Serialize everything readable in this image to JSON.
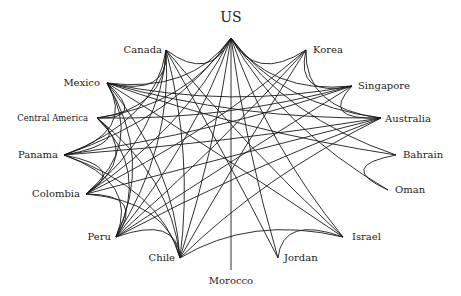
{
  "diagram": {
    "type": "network",
    "nodes": [
      {
        "id": "US",
        "label": "US",
        "x": 231,
        "y": 38,
        "lx": 231,
        "ly": 22,
        "anchor": "middle",
        "size": "big"
      },
      {
        "id": "Canada",
        "label": "Canada",
        "x": 166,
        "y": 50,
        "lx": 162,
        "ly": 53,
        "anchor": "end",
        "size": "normal"
      },
      {
        "id": "Korea",
        "label": "Korea",
        "x": 306,
        "y": 50,
        "lx": 313,
        "ly": 53,
        "anchor": "start",
        "size": "normal"
      },
      {
        "id": "Mexico",
        "label": "Mexico",
        "x": 107,
        "y": 83,
        "lx": 100,
        "ly": 86,
        "anchor": "end",
        "size": "normal"
      },
      {
        "id": "Singapore",
        "label": "Singapore",
        "x": 352,
        "y": 86,
        "lx": 358,
        "ly": 89,
        "anchor": "start",
        "size": "normal"
      },
      {
        "id": "CentralAmerica",
        "label": "Central America",
        "x": 97,
        "y": 118,
        "lx": 88,
        "ly": 121,
        "anchor": "end",
        "size": "small"
      },
      {
        "id": "Australia",
        "label": "Australia",
        "x": 381,
        "y": 118,
        "lx": 385,
        "ly": 122,
        "anchor": "start",
        "size": "normal"
      },
      {
        "id": "Panama",
        "label": "Panama",
        "x": 64,
        "y": 155,
        "lx": 58,
        "ly": 158,
        "anchor": "end",
        "size": "normal"
      },
      {
        "id": "Bahrain",
        "label": "Bahrain",
        "x": 396,
        "y": 155,
        "lx": 403,
        "ly": 158,
        "anchor": "start",
        "size": "normal"
      },
      {
        "id": "Colombia",
        "label": "Colombia",
        "x": 86,
        "y": 194,
        "lx": 80,
        "ly": 197,
        "anchor": "end",
        "size": "normal"
      },
      {
        "id": "Oman",
        "label": "Oman",
        "x": 388,
        "y": 190,
        "lx": 395,
        "ly": 193,
        "anchor": "start",
        "size": "normal"
      },
      {
        "id": "Peru",
        "label": "Peru",
        "x": 116,
        "y": 237,
        "lx": 111,
        "ly": 240,
        "anchor": "end",
        "size": "normal"
      },
      {
        "id": "Israel",
        "label": "Israel",
        "x": 343,
        "y": 237,
        "lx": 352,
        "ly": 240,
        "anchor": "start",
        "size": "normal"
      },
      {
        "id": "Chile",
        "label": "Chile",
        "x": 180,
        "y": 258,
        "lx": 175,
        "ly": 261,
        "anchor": "end",
        "size": "normal"
      },
      {
        "id": "Jordan",
        "label": "Jordan",
        "x": 278,
        "y": 258,
        "lx": 284,
        "ly": 261,
        "anchor": "start",
        "size": "normal"
      },
      {
        "id": "Morocco",
        "label": "Morocco",
        "x": 231,
        "y": 270,
        "lx": 231,
        "ly": 284,
        "anchor": "middle",
        "size": "normal"
      }
    ],
    "edges": [
      [
        "US",
        "Canada"
      ],
      [
        "US",
        "Korea"
      ],
      [
        "US",
        "Mexico"
      ],
      [
        "US",
        "Singapore"
      ],
      [
        "US",
        "CentralAmerica"
      ],
      [
        "US",
        "Australia"
      ],
      [
        "US",
        "Panama"
      ],
      [
        "US",
        "Bahrain"
      ],
      [
        "US",
        "Colombia"
      ],
      [
        "US",
        "Oman"
      ],
      [
        "US",
        "Peru"
      ],
      [
        "US",
        "Israel"
      ],
      [
        "US",
        "Chile"
      ],
      [
        "US",
        "Jordan"
      ],
      [
        "US",
        "Morocco"
      ],
      [
        "Canada",
        "Mexico"
      ],
      [
        "Canada",
        "Panama"
      ],
      [
        "Canada",
        "Colombia"
      ],
      [
        "Canada",
        "Peru"
      ],
      [
        "Canada",
        "Chile"
      ],
      [
        "Canada",
        "Jordan"
      ],
      [
        "Canada",
        "Israel"
      ],
      [
        "Canada",
        "CentralAmerica"
      ],
      [
        "Mexico",
        "CentralAmerica"
      ],
      [
        "Mexico",
        "Panama"
      ],
      [
        "Mexico",
        "Colombia"
      ],
      [
        "Mexico",
        "Peru"
      ],
      [
        "Mexico",
        "Chile"
      ],
      [
        "Mexico",
        "Israel"
      ],
      [
        "Mexico",
        "Bahrain"
      ],
      [
        "Mexico",
        "Singapore"
      ],
      [
        "Mexico",
        "Australia"
      ],
      [
        "CentralAmerica",
        "Panama"
      ],
      [
        "CentralAmerica",
        "Colombia"
      ],
      [
        "CentralAmerica",
        "Peru"
      ],
      [
        "CentralAmerica",
        "Chile"
      ],
      [
        "CentralAmerica",
        "Singapore"
      ],
      [
        "Panama",
        "Colombia"
      ],
      [
        "Panama",
        "Peru"
      ],
      [
        "Panama",
        "Chile"
      ],
      [
        "Panama",
        "Singapore"
      ],
      [
        "Panama",
        "Australia"
      ],
      [
        "Colombia",
        "Peru"
      ],
      [
        "Colombia",
        "Chile"
      ],
      [
        "Colombia",
        "Korea"
      ],
      [
        "Colombia",
        "Australia"
      ],
      [
        "Peru",
        "Chile"
      ],
      [
        "Peru",
        "Korea"
      ],
      [
        "Peru",
        "Singapore"
      ],
      [
        "Peru",
        "Australia"
      ],
      [
        "Chile",
        "Korea"
      ],
      [
        "Chile",
        "Australia"
      ],
      [
        "Chile",
        "Israel"
      ],
      [
        "Korea",
        "Singapore"
      ],
      [
        "Korea",
        "Australia"
      ],
      [
        "Singapore",
        "Australia"
      ],
      [
        "Bahrain",
        "Oman"
      ],
      [
        "Jordan",
        "Israel"
      ]
    ]
  }
}
